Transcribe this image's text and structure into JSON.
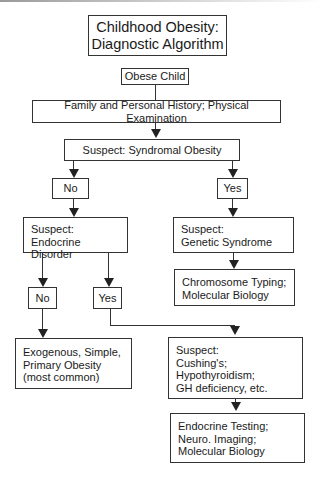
{
  "title": {
    "line1": "Childhood Obesity:",
    "line2": "Diagnostic Algorithm"
  },
  "nodes": {
    "obese_child": "Obese Child",
    "history_exam": "Family and Personal History; Physical Examination",
    "suspect_syndromal": "Suspect: Syndromal Obesity",
    "syndromal_no": "No",
    "syndromal_yes": "Yes",
    "endocrine": {
      "line1": "Suspect:",
      "line2": "Endocrine Disorder"
    },
    "genetic": {
      "line1": "Suspect:",
      "line2": "Genetic Syndrome"
    },
    "chromosome": {
      "line1": "Chromosome Typing;",
      "line2": "Molecular Biology"
    },
    "endocrine_no": "No",
    "endocrine_yes": "Yes",
    "exogenous": {
      "line1": "Exogenous, Simple,",
      "line2": "Primary Obesity",
      "line3": "(most common)"
    },
    "cushings": {
      "line1": "Suspect:",
      "line2": "Cushing's;",
      "line3": "Hypothyroidism;",
      "line4": "GH deficiency, etc."
    },
    "endocrine_testing": {
      "line1": "Endocrine Testing;",
      "line2": "Neuro. Imaging;",
      "line3": "Molecular Biology"
    }
  },
  "colors": {
    "stroke": "#333333",
    "background": "#ffffff",
    "text": "#1a1a1a"
  }
}
